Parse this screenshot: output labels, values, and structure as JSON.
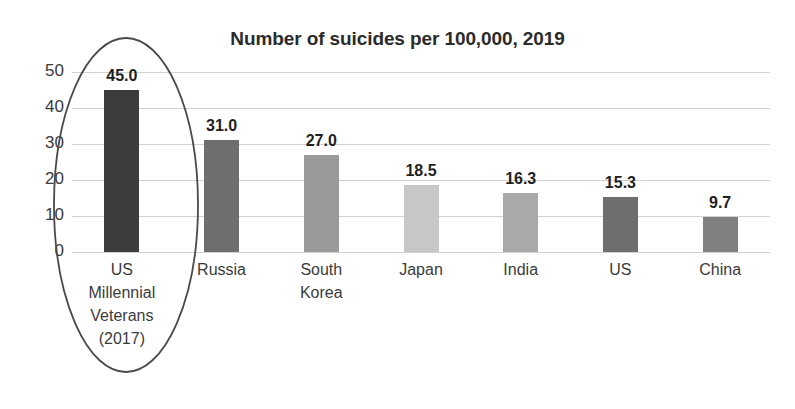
{
  "chart_data": {
    "type": "bar",
    "title": "Number of suicides per 100,000, 2019",
    "xlabel": "",
    "ylabel": "",
    "ylim": [
      0,
      50
    ],
    "yticks": [
      "0",
      "10",
      "20",
      "30",
      "40",
      "50"
    ],
    "grid": true,
    "legend": "none",
    "categories": [
      "US Millennial Veterans (2017)",
      "Russia",
      "South Korea",
      "Japan",
      "India",
      "US",
      "China"
    ],
    "category_lines": [
      [
        "US",
        "Millennial",
        "Veterans",
        "(2017)"
      ],
      [
        "Russia"
      ],
      [
        "South",
        "Korea"
      ],
      [
        "Japan"
      ],
      [
        "India"
      ],
      [
        "US"
      ],
      [
        "China"
      ]
    ],
    "values": [
      45.0,
      31.0,
      27.0,
      18.5,
      16.3,
      15.3,
      9.7
    ],
    "value_labels": [
      "45.0",
      "31.0",
      "27.0",
      "18.5",
      "16.3",
      "15.3",
      "9.7"
    ],
    "bar_colors": [
      "#3c3c3c",
      "#6e6e6e",
      "#9a9a9a",
      "#c7c7c7",
      "#a9a9a9",
      "#6e6e6e",
      "#808080"
    ],
    "annotations": [
      {
        "type": "ellipse",
        "target": "US Millennial Veterans (2017)",
        "color": "#4a4a4a"
      }
    ]
  },
  "axis": {
    "gridline_color": "#d2d2d2",
    "baseline_color": "#b9b9b9"
  }
}
